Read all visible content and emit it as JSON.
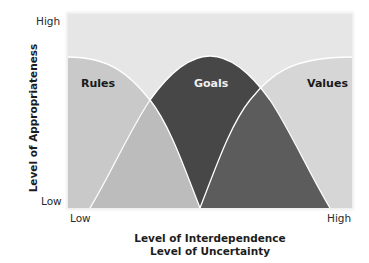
{
  "figure": {
    "y_axis": {
      "label": "Level of Appropriateness",
      "tick_high": "High",
      "tick_low": "Low"
    },
    "x_axis": {
      "label_line1": "Level of Interdependence",
      "label_line2": "Level of Uncertainty",
      "tick_low": "Low",
      "tick_high": "High"
    },
    "regions": {
      "rules": "Rules",
      "goals": "Goals",
      "values": "Values"
    },
    "colors": {
      "plot_background": "#e6e6e6",
      "rules_fill": "#c9c9c9",
      "goals_fill": "#474747",
      "values_fill": "#d6d6d6",
      "rules_goals_overlap": "#bcbcbc",
      "goals_values_overlap": "#5c5c5c",
      "boundary_line": "#ffffff"
    }
  }
}
